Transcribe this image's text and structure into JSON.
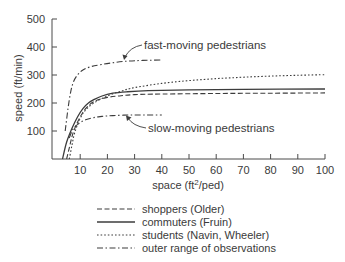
{
  "chart_data": {
    "type": "line",
    "title": "",
    "xlabel": "space (ft²/ped)",
    "xlabel_parts": {
      "pre": "space (ft",
      "sup": "2",
      "post": "/ped)"
    },
    "ylabel": "speed (ft/min)",
    "xlim": [
      0,
      100
    ],
    "ylim": [
      0,
      500
    ],
    "xticks": [
      10,
      20,
      30,
      40,
      50,
      60,
      70,
      80,
      90,
      100
    ],
    "yticks": [
      100,
      200,
      300,
      400,
      500
    ],
    "grid": false,
    "legend_position": "bottom",
    "series": [
      {
        "name": "shoppers (Older)",
        "style": "dashed",
        "x": [
          5,
          6,
          7,
          8,
          10,
          12,
          15,
          20,
          25,
          30,
          40,
          60,
          80,
          100
        ],
        "y": [
          0,
          40,
          80,
          110,
          150,
          180,
          205,
          220,
          226,
          230,
          232,
          234,
          235,
          236
        ]
      },
      {
        "name": "commuters (Fruin)",
        "style": "solid",
        "x": [
          3.5,
          5,
          7,
          9,
          11,
          13,
          15,
          18,
          22,
          27,
          35,
          50,
          70,
          100
        ],
        "y": [
          0,
          60,
          110,
          150,
          180,
          200,
          212,
          225,
          235,
          240,
          244,
          247,
          249,
          250
        ]
      },
      {
        "name": "students (Navin, Wheeler)",
        "style": "dotted",
        "x": [
          6,
          7,
          8,
          10,
          12,
          15,
          20,
          25,
          30,
          40,
          50,
          60,
          70,
          80,
          90,
          100
        ],
        "y": [
          0,
          50,
          95,
          145,
          175,
          200,
          225,
          242,
          255,
          270,
          280,
          287,
          292,
          296,
          299,
          301
        ]
      },
      {
        "name": "outer range of observations (fast-moving)",
        "style": "dashdot",
        "x": [
          4.5,
          5.5,
          6.5,
          7.5,
          9,
          11,
          14,
          18,
          23,
          28,
          33,
          40
        ],
        "y": [
          100,
          180,
          240,
          275,
          300,
          318,
          330,
          338,
          345,
          350,
          352,
          354
        ]
      },
      {
        "name": "outer range of observations (slow-moving)",
        "style": "dashdot",
        "x": [
          6,
          7,
          8,
          10,
          12,
          15,
          18,
          22,
          28,
          34,
          40
        ],
        "y": [
          75,
          100,
          115,
          130,
          140,
          148,
          152,
          155,
          157,
          157,
          157
        ]
      }
    ],
    "annotations": [
      {
        "text": "fast-moving pedestrians",
        "points_to": {
          "x": 25,
          "y": 352
        }
      },
      {
        "text": "slow-moving pedestrians",
        "points_to": {
          "x": 25,
          "y": 157
        }
      }
    ],
    "legend": [
      {
        "label": "shoppers (Older)",
        "style": "dashed"
      },
      {
        "label": "commuters (Fruin)",
        "style": "solid"
      },
      {
        "label": "students (Navin, Wheeler)",
        "style": "dotted"
      },
      {
        "label": "outer range of observations",
        "style": "dashdot"
      }
    ]
  },
  "colors": {
    "line": "#3c3c3c",
    "text": "#3a3a3a",
    "axis": "#4a4a4a"
  }
}
